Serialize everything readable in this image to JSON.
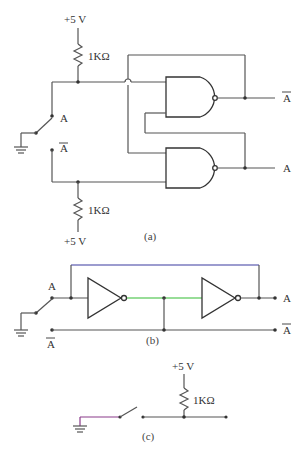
{
  "circuit_a": {
    "caption": "(a)",
    "supply_top": "+5 V",
    "resistor_top": "1KΩ",
    "supply_bottom": "+5 V",
    "resistor_bottom": "1KΩ",
    "switch_label_a": "A",
    "switch_label_abar": "A",
    "output_top": "A",
    "output_bottom": "A",
    "gates": [
      "NAND",
      "NAND"
    ]
  },
  "circuit_b": {
    "caption": "(b)",
    "switch_label_a": "A",
    "switch_label_abar": "A",
    "output_a": "A",
    "output_abar": "A",
    "gates": [
      "NOT",
      "NOT"
    ],
    "colors": {
      "feedback_wire": "#3a3aa0",
      "middle_wire": "#33bb33"
    }
  },
  "circuit_c": {
    "caption": "(c)",
    "supply": "+5 V",
    "resistor": "1KΩ",
    "colors": {
      "ground_wire": "#8a3a8a"
    }
  }
}
